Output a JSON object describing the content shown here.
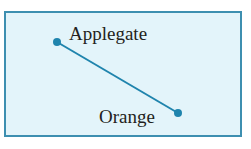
{
  "diagram": {
    "colors": {
      "border": "#3d8fb0",
      "fill": "#e3f4fa",
      "line": "#1f84ad",
      "text": "#231f20"
    },
    "points": [
      {
        "label": "Applegate",
        "x": 57,
        "y": 42
      },
      {
        "label": "Orange",
        "x": 178,
        "y": 113
      }
    ]
  }
}
